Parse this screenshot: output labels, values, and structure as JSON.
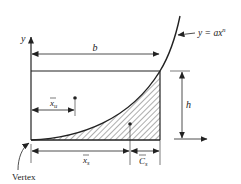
{
  "diagram": {
    "title": "",
    "labels": {
      "y_axis": "y",
      "curve_equation_prefix": "y = ax",
      "curve_equation_exponent": "n",
      "width": "b",
      "height": "h",
      "xbar_unshaded_base": "x",
      "xbar_unshaded_sub": "u",
      "xbar_shaded_base": "x",
      "xbar_shaded_sub": "s",
      "c_shaded_base": "C",
      "c_shaded_sub": "s",
      "vertex": "Vertex"
    },
    "regions": [
      {
        "name": "unshaded",
        "description": "area above curve within b×h rectangle"
      },
      {
        "name": "shaded",
        "description": "hatched area under curve y = ax^n"
      }
    ],
    "colors": {
      "ink": "#222222",
      "background": "#ffffff"
    }
  }
}
